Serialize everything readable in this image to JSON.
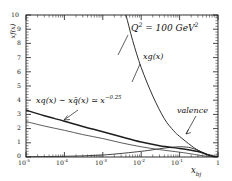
{
  "chart_data": {
    "type": "line",
    "title": "",
    "xlabel": "x_bj",
    "ylabel": "xf(x)",
    "xscale": "log",
    "yscale": "linear",
    "xlim": [
      1e-05,
      1
    ],
    "ylim": [
      0,
      10
    ],
    "grid": false,
    "legend_position": "none",
    "xticklabels": [
      "10-5",
      "10-4",
      "10-3",
      "10-2",
      "10-1",
      "1"
    ],
    "xtickvalues": [
      1e-05,
      0.0001,
      0.001,
      0.01,
      0.1,
      1
    ],
    "yticklabels": [
      "0",
      "1",
      "2",
      "3",
      "4",
      "5",
      "6",
      "7",
      "8",
      "9",
      "10"
    ],
    "ytickvalues": [
      0,
      1,
      2,
      3,
      4,
      5,
      6,
      7,
      8,
      9,
      10
    ],
    "annotations": [
      {
        "id": "q2",
        "text": "Q2 = 100 GeV2",
        "x": 0.012,
        "y": 8.8
      },
      {
        "id": "xg",
        "text": "xg(x)",
        "x": 0.022,
        "y": 6.4
      },
      {
        "id": "sea",
        "text": "xq(x) ~ xqbar(x) ~= x^-0.25",
        "x": 0.0002,
        "y": 3.6
      },
      {
        "id": "valence",
        "text": "valence",
        "x": 0.22,
        "y": 2.5
      }
    ],
    "series": [
      {
        "name": "xg(x)",
        "comment": "gluon distribution, steeply rising at small x",
        "x": [
          1e-05,
          3e-05,
          0.0001,
          0.0003,
          0.001,
          0.002,
          0.003,
          0.004,
          0.006,
          0.01,
          0.02,
          0.04,
          0.07,
          0.1,
          0.2,
          0.3,
          0.5,
          0.7,
          1.0
        ],
        "y": [
          120,
          78,
          50,
          31,
          18.5,
          13.2,
          11.0,
          10.0,
          8.2,
          6.3,
          4.3,
          2.7,
          1.85,
          1.45,
          0.8,
          0.48,
          0.17,
          0.04,
          0.0
        ]
      },
      {
        "name": "xq(x) sea",
        "comment": "sea quark distribution, thick line, ~ x^-0.25",
        "x": [
          1e-05,
          3e-05,
          0.0001,
          0.0003,
          0.001,
          0.003,
          0.01,
          0.03,
          0.1,
          0.2,
          0.3,
          0.5,
          0.7,
          1.0
        ],
        "y": [
          3.3,
          2.9,
          2.52,
          2.15,
          1.78,
          1.42,
          1.05,
          0.8,
          0.6,
          0.48,
          0.38,
          0.2,
          0.07,
          0.0
        ]
      },
      {
        "name": "xqbar(x) antiquark sea",
        "comment": "antiquark sea, thinner line slightly below",
        "x": [
          1e-05,
          3e-05,
          0.0001,
          0.0003,
          0.001,
          0.003,
          0.01,
          0.03,
          0.1,
          0.2,
          0.3,
          0.5,
          0.7,
          1.0
        ],
        "y": [
          2.5,
          2.18,
          1.88,
          1.58,
          1.3,
          1.0,
          0.72,
          0.52,
          0.34,
          0.22,
          0.14,
          0.05,
          0.01,
          0.0
        ]
      },
      {
        "name": "valence",
        "comment": "valence quark distribution, broad bump peaking near x=0.1",
        "x": [
          1e-05,
          0.0001,
          0.001,
          0.01,
          0.03,
          0.06,
          0.1,
          0.15,
          0.2,
          0.3,
          0.45,
          0.6,
          0.8,
          1.0
        ],
        "y": [
          0.02,
          0.05,
          0.14,
          0.4,
          0.58,
          0.68,
          0.72,
          0.7,
          0.64,
          0.47,
          0.26,
          0.12,
          0.02,
          0.0
        ]
      }
    ]
  },
  "axes": {
    "ylabel_display": "xf(x)",
    "xlabel_display": "x",
    "xlabel_sub": "bj",
    "yticks": [
      {
        "value": 10,
        "label": "10"
      },
      {
        "value": 9,
        "label": "9"
      },
      {
        "value": 8,
        "label": "8"
      },
      {
        "value": 7,
        "label": "7"
      },
      {
        "value": 6,
        "label": "6"
      },
      {
        "value": 5,
        "label": "5"
      },
      {
        "value": 4,
        "label": "4"
      },
      {
        "value": 3,
        "label": "3"
      },
      {
        "value": 2,
        "label": "2"
      },
      {
        "value": 1,
        "label": "1"
      },
      {
        "value": 0,
        "label": "0"
      }
    ],
    "xticks": [
      {
        "value": 1e-05,
        "mantissa": "10",
        "exponent": "-5"
      },
      {
        "value": 0.0001,
        "mantissa": "10",
        "exponent": "-4"
      },
      {
        "value": 0.001,
        "mantissa": "10",
        "exponent": "-3"
      },
      {
        "value": 0.01,
        "mantissa": "10",
        "exponent": "-2"
      },
      {
        "value": 0.1,
        "mantissa": "10",
        "exponent": "-1"
      },
      {
        "value": 1,
        "mantissa": "1",
        "exponent": ""
      }
    ]
  },
  "annotations": {
    "q2": {
      "var": "Q",
      "var_sup": "2",
      "eq": " = 100 GeV",
      "unit_sup": "2"
    },
    "xg": {
      "text": "xg(x)"
    },
    "sea": {
      "part1": "xq(x) ",
      "sim": "∼",
      "part2": " x",
      "qbar": "q̄",
      "part3": "(x) ",
      "simeq": "≃",
      "part4": " x",
      "exp": "−0.25"
    },
    "valence": {
      "text": "valence"
    }
  }
}
